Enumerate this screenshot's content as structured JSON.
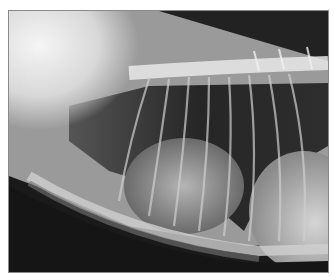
{
  "image": {
    "subject": "lateral thoracic radiograph",
    "description": "Lateral chest X-ray showing spine across top, ribs, sternum along bottom, and heart silhouette in center",
    "colors": {
      "background": "#ffffff",
      "border": "#8a8a8a",
      "dark": "#111111",
      "bright": "#f2f2f2"
    }
  }
}
